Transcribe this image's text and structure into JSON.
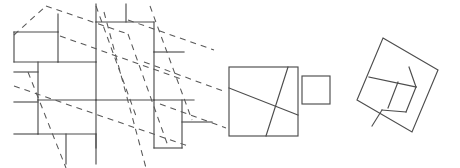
{
  "figure": {
    "background_color": "#ffffff",
    "stroke_color": "#4d4d4d",
    "dashed_stroke_color": "#585858",
    "canvas": {
      "width": 460,
      "height": 168
    },
    "panels": [
      {
        "id": "tiling-panel",
        "name": "square-tiling-with-dashed-lattice",
        "description": "Plane tiling by two sizes of squares overlaid with a dashed tilted square lattice"
      },
      {
        "id": "two-squares-panel",
        "name": "two-squares-with-cut-lines",
        "description": "A large square with two crossing cut lines next to a small square"
      },
      {
        "id": "tilted-square-panel",
        "name": "tilted-square-pinwheel-dissection",
        "description": "A tilted square dissected into four congruent pieces plus a central square"
      }
    ],
    "tiling": {
      "name": "pythagorean-tiling",
      "large_square_side": 58,
      "small_square_side": 30,
      "solid_segments": [
        {
          "x1": 14,
          "y1": 32,
          "x2": 58,
          "y2": 32
        },
        {
          "x1": 58,
          "y1": 32,
          "x2": 58,
          "y2": 62
        },
        {
          "x1": 14,
          "y1": 62,
          "x2": 58,
          "y2": 62
        },
        {
          "x1": 14,
          "y1": 32,
          "x2": 14,
          "y2": 62
        },
        {
          "x1": 58,
          "y1": 14,
          "x2": 58,
          "y2": 32
        },
        {
          "x1": 58,
          "y1": 62,
          "x2": 96,
          "y2": 62
        },
        {
          "x1": 96,
          "y1": 4,
          "x2": 96,
          "y2": 22
        },
        {
          "x1": 96,
          "y1": 22,
          "x2": 154,
          "y2": 22
        },
        {
          "x1": 126,
          "y1": 4,
          "x2": 126,
          "y2": 22
        },
        {
          "x1": 154,
          "y1": 22,
          "x2": 154,
          "y2": 52
        },
        {
          "x1": 154,
          "y1": 52,
          "x2": 184,
          "y2": 52
        },
        {
          "x1": 96,
          "y1": 22,
          "x2": 96,
          "y2": 62
        },
        {
          "x1": 96,
          "y1": 62,
          "x2": 96,
          "y2": 100
        },
        {
          "x1": 96,
          "y1": 100,
          "x2": 154,
          "y2": 100
        },
        {
          "x1": 154,
          "y1": 52,
          "x2": 154,
          "y2": 100
        },
        {
          "x1": 154,
          "y1": 100,
          "x2": 154,
          "y2": 148
        },
        {
          "x1": 96,
          "y1": 100,
          "x2": 96,
          "y2": 148
        },
        {
          "x1": 38,
          "y1": 62,
          "x2": 38,
          "y2": 100
        },
        {
          "x1": 14,
          "y1": 72,
          "x2": 38,
          "y2": 72
        },
        {
          "x1": 14,
          "y1": 102,
          "x2": 38,
          "y2": 102
        },
        {
          "x1": 38,
          "y1": 100,
          "x2": 96,
          "y2": 100
        },
        {
          "x1": 38,
          "y1": 100,
          "x2": 38,
          "y2": 134
        },
        {
          "x1": 38,
          "y1": 134,
          "x2": 96,
          "y2": 134
        },
        {
          "x1": 66,
          "y1": 134,
          "x2": 66,
          "y2": 164
        },
        {
          "x1": 96,
          "y1": 134,
          "x2": 96,
          "y2": 164
        },
        {
          "x1": 154,
          "y1": 100,
          "x2": 194,
          "y2": 100
        },
        {
          "x1": 182,
          "y1": 100,
          "x2": 182,
          "y2": 148
        },
        {
          "x1": 182,
          "y1": 122,
          "x2": 212,
          "y2": 122
        },
        {
          "x1": 154,
          "y1": 148,
          "x2": 182,
          "y2": 148
        },
        {
          "x1": 14,
          "y1": 134,
          "x2": 38,
          "y2": 134
        }
      ],
      "dashed_segments": [
        {
          "x1": 14,
          "y1": 35,
          "x2": 46,
          "y2": 6
        },
        {
          "x1": 46,
          "y1": 6,
          "x2": 128,
          "y2": 34
        },
        {
          "x1": 28,
          "y1": 72,
          "x2": 66,
          "y2": 168
        },
        {
          "x1": 14,
          "y1": 86,
          "x2": 188,
          "y2": 146
        },
        {
          "x1": 96,
          "y1": 6,
          "x2": 136,
          "y2": 116
        },
        {
          "x1": 60,
          "y1": 36,
          "x2": 184,
          "y2": 80
        },
        {
          "x1": 104,
          "y1": 12,
          "x2": 146,
          "y2": 168
        },
        {
          "x1": 128,
          "y1": 34,
          "x2": 168,
          "y2": 146
        },
        {
          "x1": 150,
          "y1": 6,
          "x2": 192,
          "y2": 120
        },
        {
          "x1": 128,
          "y1": 20,
          "x2": 214,
          "y2": 50
        },
        {
          "x1": 144,
          "y1": 62,
          "x2": 226,
          "y2": 92
        },
        {
          "x1": 160,
          "y1": 104,
          "x2": 226,
          "y2": 128
        }
      ]
    },
    "two_squares": {
      "large_square": {
        "x": 229,
        "y": 67,
        "size": 69,
        "cut_lines": [
          {
            "x1": 229,
            "y1": 88,
            "x2": 298,
            "y2": 115
          },
          {
            "x1": 266,
            "y1": 136,
            "x2": 288,
            "y2": 67
          }
        ]
      },
      "small_square": {
        "x": 302,
        "y": 76,
        "size": 28
      }
    },
    "tilted_square": {
      "outer_vertices": [
        {
          "x": 383,
          "y": 38
        },
        {
          "x": 438,
          "y": 70
        },
        {
          "x": 412,
          "y": 132
        },
        {
          "x": 357,
          "y": 100
        }
      ],
      "inner_segments": [
        {
          "x1": 369,
          "y1": 77,
          "x2": 416,
          "y2": 87
        },
        {
          "x1": 416,
          "y1": 87,
          "x2": 406,
          "y2": 112
        },
        {
          "x1": 406,
          "y1": 112,
          "x2": 382,
          "y2": 110
        },
        {
          "x1": 382,
          "y1": 110,
          "x2": 372,
          "y2": 126
        },
        {
          "x1": 398,
          "y1": 82,
          "x2": 388,
          "y2": 108
        },
        {
          "x1": 416,
          "y1": 87,
          "x2": 409,
          "y2": 67
        }
      ]
    }
  }
}
